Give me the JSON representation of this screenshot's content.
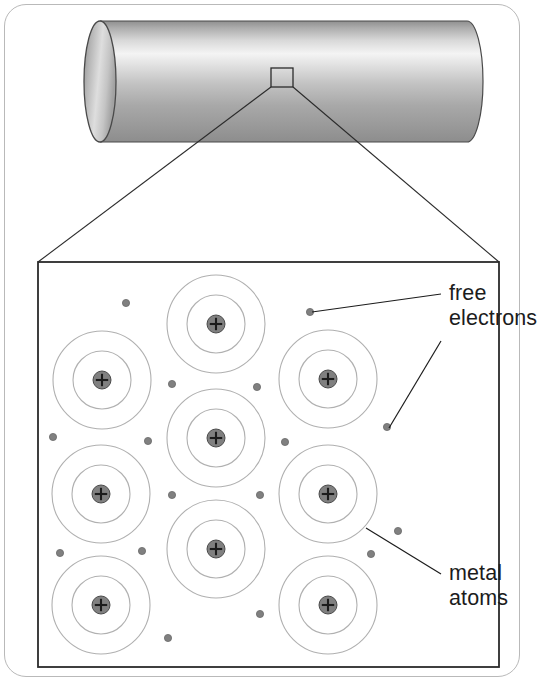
{
  "labels": {
    "free_electrons_line1": "free",
    "free_electrons_line2": "electrons",
    "metal_atoms_line1": "metal",
    "metal_atoms_line2": "atoms"
  },
  "colors": {
    "frame_border": "#b9b9b9",
    "detail_box_border": "#2b2b2b",
    "orbit_ring": "#b0b0b0",
    "nucleus_fill": "#808080",
    "nucleus_stroke": "#4a4a4a",
    "electron_fill": "#808080",
    "electron_stroke": "#6a6a6a",
    "leader_line": "#1c1c1c",
    "text": "#1c1c1c",
    "cylinder_light": "#f2f2f2",
    "cylinder_mid": "#c9c9c9",
    "cylinder_dark": "#8a8a8a"
  },
  "cylinder": {
    "name": "metal-rod",
    "left": 100,
    "right": 467,
    "top": 21,
    "bottom": 142,
    "cap_rx": 16,
    "cap_cy": 81
  },
  "zoom_box": {
    "name": "magnified-region-marker",
    "x": 271,
    "y": 68,
    "w": 22,
    "h": 19
  },
  "callout": {
    "left_line": {
      "x1": 271,
      "y1": 87,
      "x2": 38,
      "y2": 262
    },
    "right_line": {
      "x1": 293,
      "y1": 87,
      "x2": 499,
      "y2": 262
    }
  },
  "detail_box": {
    "name": "magnified-detail-view",
    "x": 38,
    "y": 262,
    "w": 461,
    "h": 405
  },
  "nucleus_symbol": "+",
  "atoms": [
    {
      "cx": 216,
      "cy": 324,
      "r_outer": 49,
      "r_inner": 29,
      "r_nucleus": 9
    },
    {
      "cx": 102,
      "cy": 380,
      "r_outer": 49,
      "r_inner": 29,
      "r_nucleus": 9
    },
    {
      "cx": 328,
      "cy": 379,
      "r_outer": 49,
      "r_inner": 29,
      "r_nucleus": 9
    },
    {
      "cx": 216,
      "cy": 438,
      "r_outer": 49,
      "r_inner": 29,
      "r_nucleus": 9
    },
    {
      "cx": 101,
      "cy": 494,
      "r_outer": 49,
      "r_inner": 29,
      "r_nucleus": 9
    },
    {
      "cx": 328,
      "cy": 494,
      "r_outer": 49,
      "r_inner": 29,
      "r_nucleus": 9
    },
    {
      "cx": 216,
      "cy": 549,
      "r_outer": 49,
      "r_inner": 29,
      "r_nucleus": 9
    },
    {
      "cx": 101,
      "cy": 605,
      "r_outer": 49,
      "r_inner": 29,
      "r_nucleus": 9
    },
    {
      "cx": 328,
      "cy": 605,
      "r_outer": 49,
      "r_inner": 29,
      "r_nucleus": 9
    }
  ],
  "electrons": [
    {
      "cx": 126,
      "cy": 303,
      "r": 3.6
    },
    {
      "cx": 310,
      "cy": 312,
      "r": 3.6
    },
    {
      "cx": 172,
      "cy": 384,
      "r": 3.6
    },
    {
      "cx": 257,
      "cy": 387,
      "r": 3.6
    },
    {
      "cx": 387,
      "cy": 427,
      "r": 3.6
    },
    {
      "cx": 53,
      "cy": 437,
      "r": 3.6
    },
    {
      "cx": 148,
      "cy": 441,
      "r": 3.6
    },
    {
      "cx": 285,
      "cy": 442,
      "r": 3.6
    },
    {
      "cx": 172,
      "cy": 495,
      "r": 3.6
    },
    {
      "cx": 260,
      "cy": 495,
      "r": 3.6
    },
    {
      "cx": 398,
      "cy": 531,
      "r": 3.6
    },
    {
      "cx": 60,
      "cy": 553,
      "r": 3.6
    },
    {
      "cx": 142,
      "cy": 551,
      "r": 3.6
    },
    {
      "cx": 371,
      "cy": 554,
      "r": 3.6
    },
    {
      "cx": 260,
      "cy": 614,
      "r": 3.6
    },
    {
      "cx": 168,
      "cy": 638,
      "r": 3.6
    }
  ],
  "leaders": {
    "free_electrons": [
      {
        "x1": 441,
        "y1": 294,
        "x2": 312,
        "y2": 312
      },
      {
        "x1": 441,
        "y1": 341,
        "x2": 389,
        "y2": 428
      }
    ],
    "metal_atoms": [
      {
        "x1": 441,
        "y1": 574,
        "x2": 366,
        "y2": 528
      }
    ]
  }
}
